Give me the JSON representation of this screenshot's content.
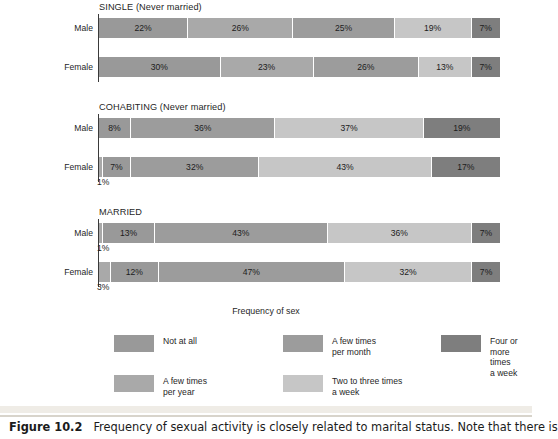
{
  "figure": {
    "label": "Figure 10.2",
    "caption": "Frequency of sexual activity is closely related to marital status. Note that there is"
  },
  "legend": {
    "title": "Frequency of sex",
    "items": [
      {
        "key": "not_at_all",
        "label": "Not at all",
        "color": "#999999"
      },
      {
        "key": "few_month",
        "label": "A few times\nper month",
        "color": "#9c9c9c"
      },
      {
        "key": "four_plus",
        "label": "Four or more times\na week",
        "color": "#7e7e7e"
      },
      {
        "key": "few_year",
        "label": "A few times\nper year",
        "color": "#a9a9a9"
      },
      {
        "key": "two_three",
        "label": "Two to three times\na week",
        "color": "#c6c6c6"
      }
    ]
  },
  "chart_data": {
    "type": "bar",
    "orientation": "horizontal",
    "stacked": true,
    "title": "Frequency of sexual activity is closely related to marital status",
    "xlabel": "",
    "ylabel": "",
    "xlim": [
      0,
      100
    ],
    "grid": false,
    "legend_position": "bottom",
    "units": "percent",
    "categories": [
      "Not at all",
      "A few times per year",
      "A few times per month",
      "Two to three times a week",
      "Four or more times a week"
    ],
    "category_colors": [
      "#999999",
      "#a9a9a9",
      "#9c9c9c",
      "#c6c6c6",
      "#7e7e7e"
    ],
    "groups": [
      {
        "name": "SINGLE (Never married)",
        "rows": [
          {
            "name": "Male",
            "values": [
              22,
              26,
              25,
              19,
              7
            ],
            "labels": [
              "22%",
              "26%",
              "25%",
              "19%",
              "7%"
            ]
          },
          {
            "name": "Female",
            "values": [
              30,
              23,
              26,
              13,
              7
            ],
            "labels": [
              "30%",
              "23%",
              "26%",
              "13%",
              "7%"
            ]
          }
        ]
      },
      {
        "name": "COHABITING (Never married)",
        "rows": [
          {
            "name": "Male",
            "values": [
              8,
              36,
              37,
              19
            ],
            "labels": [
              "8%",
              "36%",
              "37%",
              "19%"
            ],
            "segment_colors": [
              "#999999",
              "#9c9c9c",
              "#c6c6c6",
              "#7e7e7e"
            ]
          },
          {
            "name": "Female",
            "values": [
              1,
              7,
              32,
              43,
              17
            ],
            "labels": [
              "",
              "7%",
              "32%",
              "43%",
              "17%"
            ],
            "segment_colors": [
              "#a9a9a9",
              "#999999",
              "#9c9c9c",
              "#c6c6c6",
              "#7e7e7e"
            ],
            "outside_label": "1%"
          }
        ]
      },
      {
        "name": "MARRIED",
        "rows": [
          {
            "name": "Male",
            "values": [
              1,
              13,
              43,
              36,
              7
            ],
            "labels": [
              "",
              "13%",
              "43%",
              "36%",
              "7%"
            ],
            "segment_colors": [
              "#a9a9a9",
              "#999999",
              "#9c9c9c",
              "#c6c6c6",
              "#7e7e7e"
            ],
            "outside_label": "1%"
          },
          {
            "name": "Female",
            "values": [
              3,
              12,
              47,
              32,
              7
            ],
            "labels": [
              "",
              "12%",
              "47%",
              "32%",
              "7%"
            ],
            "segment_colors": [
              "#a9a9a9",
              "#999999",
              "#9c9c9c",
              "#c6c6c6",
              "#7e7e7e"
            ],
            "outside_label": "3%"
          }
        ]
      }
    ]
  },
  "layout": {
    "panels": [
      {
        "top": 0,
        "title_top": 2,
        "axis_top": 14,
        "axis_height": 68,
        "rows": [
          {
            "bar_top": 18,
            "label_top": 23
          },
          {
            "bar_top": 57,
            "label_top": 62
          }
        ]
      },
      {
        "top": 100,
        "title_top": 2,
        "axis_top": 14,
        "axis_height": 68,
        "rows": [
          {
            "bar_top": 18,
            "label_top": 23
          },
          {
            "bar_top": 57,
            "label_top": 62
          }
        ]
      },
      {
        "top": 205,
        "title_top": 2,
        "axis_top": 14,
        "axis_height": 68,
        "rows": [
          {
            "bar_top": 18,
            "label_top": 23
          },
          {
            "bar_top": 57,
            "label_top": 62
          }
        ]
      }
    ],
    "legend_top": 306,
    "legend_columns": [
      114,
      283,
      441
    ],
    "legend_rows": [
      29,
      69
    ]
  }
}
